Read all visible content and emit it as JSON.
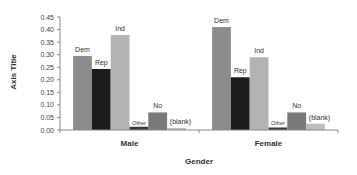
{
  "chart_data": {
    "type": "bar",
    "title": "",
    "xlabel": "Gender",
    "ylabel": "Axis Title",
    "ylim": [
      0,
      0.45
    ],
    "yticks": [
      "0.00",
      "0.05",
      "0.10",
      "0.15",
      "0.20",
      "0.25",
      "0.30",
      "0.35",
      "0.40",
      "0.45"
    ],
    "grid": false,
    "legend": "none (data labels on bars)",
    "categories": [
      "Male",
      "Female"
    ],
    "series": [
      {
        "name": "Dem",
        "color": "#8c8c8c",
        "values": [
          0.295,
          0.41
        ]
      },
      {
        "name": "Rep",
        "color": "#1c1c1c",
        "values": [
          0.243,
          0.21
        ]
      },
      {
        "name": "Ind",
        "color": "#b3b3b3",
        "values": [
          0.378,
          0.29
        ]
      },
      {
        "name": "Other",
        "color": "#3a3a3a",
        "values": [
          0.013,
          0.01
        ]
      },
      {
        "name": "No",
        "color": "#7a7a7a",
        "values": [
          0.07,
          0.07
        ]
      },
      {
        "name": "(blank)",
        "color": "#bdbdbd",
        "values": [
          0.008,
          0.025
        ]
      }
    ]
  }
}
